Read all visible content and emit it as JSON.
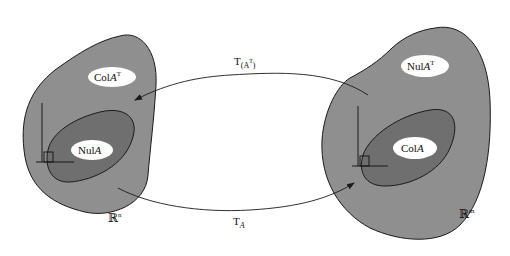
{
  "diagram": {
    "left_space": {
      "name": "R^n",
      "label_main": "ℝ",
      "label_sup": "n",
      "outer_subspace": {
        "main": "Col",
        "italic": "A",
        "sup": "T"
      },
      "inner_subspace": {
        "main": "Nul",
        "italic": "A",
        "sup": ""
      }
    },
    "right_space": {
      "name": "R^m",
      "label_main": "ℝ",
      "label_sup": "m",
      "outer_subspace": {
        "main": "Nul",
        "italic": "A",
        "sup": "T"
      },
      "inner_subspace": {
        "main": "Col",
        "italic": "A",
        "sup": ""
      }
    },
    "arrows": {
      "top": {
        "main": "T",
        "sub": "(A",
        "sub_sup": "T",
        "sub_close": ")",
        "direction": "right-to-left"
      },
      "bottom": {
        "main": "T",
        "sub": "A",
        "direction": "left-to-right"
      }
    },
    "colors": {
      "outer_region": "#8f8f8f",
      "inner_region": "#6f6f6f",
      "label_oval": "#ffffff",
      "stroke": "#1a1a1a"
    }
  }
}
